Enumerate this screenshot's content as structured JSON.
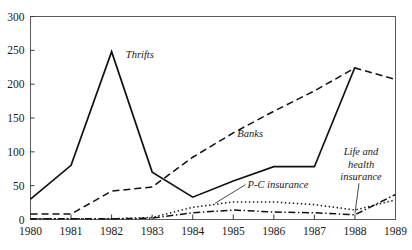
{
  "figure": {
    "title_partial": "",
    "caption_partial": ""
  },
  "chart_data": {
    "type": "line",
    "title": "",
    "xlabel": "",
    "ylabel": "",
    "xlim": [
      1980,
      1989
    ],
    "ylim": [
      0,
      300
    ],
    "yticks": [
      0,
      50,
      100,
      150,
      200,
      250,
      300
    ],
    "xticks": [
      1980,
      1981,
      1982,
      1983,
      1984,
      1985,
      1986,
      1987,
      1988,
      1989
    ],
    "x": [
      1980,
      1981,
      1982,
      1983,
      1984,
      1985,
      1986,
      1987,
      1988,
      1989
    ],
    "grid": false,
    "legend_position": "inline-annotations",
    "frame": "box",
    "series": [
      {
        "name": "Thrifts",
        "style": "solid",
        "color": "#111111",
        "values": [
          30,
          80,
          248,
          70,
          33,
          57,
          78,
          78,
          225,
          0
        ],
        "label_x": 1982.35,
        "label_y": 238,
        "truncated_after": 1988
      },
      {
        "name": "Banks",
        "style": "dashed",
        "color": "#111111",
        "values": [
          8,
          8,
          42,
          48,
          92,
          128,
          160,
          190,
          224,
          207
        ],
        "label_x": 1985.1,
        "label_y": 122
      },
      {
        "name": "P-C insurance",
        "style": "dotted",
        "color": "#111111",
        "values": [
          1,
          1,
          1,
          3,
          18,
          26,
          26,
          22,
          14,
          29
        ],
        "label_x": 1985.35,
        "label_y": 47
      },
      {
        "name": "Life and health insurance",
        "style": "dashdot",
        "color": "#111111",
        "values": [
          1,
          1,
          1,
          2,
          10,
          14,
          11,
          10,
          7,
          37
        ],
        "label_lines": [
          "Life and",
          "health",
          "insurance"
        ],
        "label_x": 1988.15,
        "label_y": 95,
        "leader_to_x": 1988.0,
        "leader_to_y": 9
      }
    ],
    "tick_labels_y": [
      "0",
      "50",
      "100",
      "150",
      "200",
      "250",
      "300"
    ],
    "tick_labels_x": [
      "1980",
      "1981",
      "1982",
      "1983",
      "1984",
      "1985",
      "1986",
      "1987",
      "1988",
      "1989"
    ]
  }
}
